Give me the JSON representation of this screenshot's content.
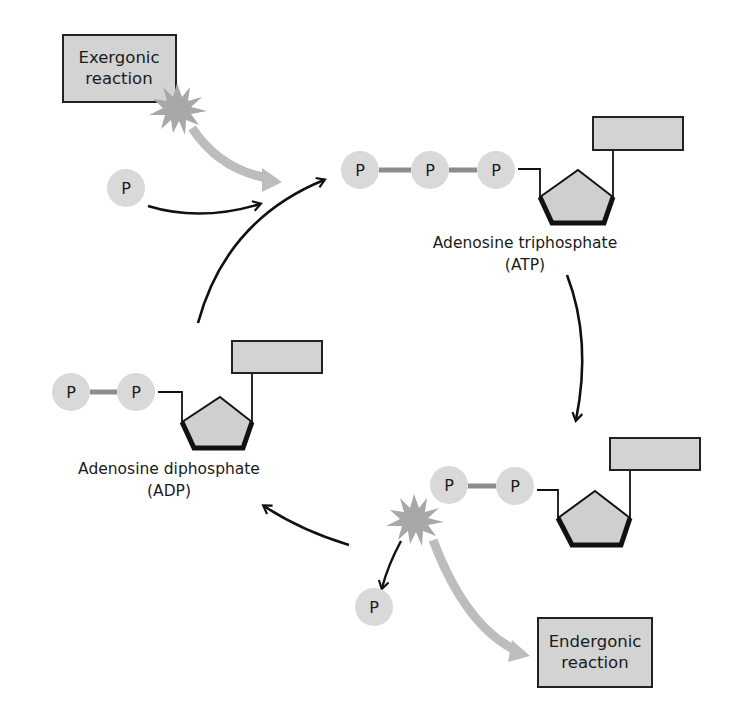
{
  "diagram": {
    "colors": {
      "phosphate_fill": "#d9d9d9",
      "bond_gray": "#8c8c8c",
      "box_fill": "#d3d3d3",
      "pentagon_fill": "#cfcfcf",
      "energy_arrow": "#bdbdbd",
      "starburst": "#a8a8a8",
      "line": "#111111"
    },
    "exergonic": {
      "line1": "Exergonic",
      "line2": "reaction"
    },
    "endergonic": {
      "line1": "Endergonic",
      "line2": "reaction"
    },
    "free_phosphate_in": {
      "label": "P"
    },
    "free_phosphate_out": {
      "label": "P"
    },
    "atp": {
      "phosphates": [
        "P",
        "P",
        "P"
      ],
      "name": "Adenosine triphosphate",
      "abbr": "(ATP)"
    },
    "adp_left": {
      "phosphates": [
        "P",
        "P"
      ],
      "name": "Adenosine diphosphate",
      "abbr": "(ADP)"
    },
    "adp_bottom": {
      "phosphates": [
        "P",
        "P"
      ]
    }
  }
}
